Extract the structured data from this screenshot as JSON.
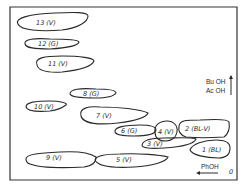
{
  "diagram": {
    "type": "two-dimensional paper chromatogram map",
    "solvents": {
      "vertical": "Bu OH / Ac OH",
      "vertical_top": "Bu OH",
      "vertical_bottom": "Ac OH",
      "horizontal": "PhOH"
    },
    "origin_label": "0",
    "spots": [
      {
        "id": "13",
        "label": "13 (V)"
      },
      {
        "id": "12",
        "label": "12 (G)"
      },
      {
        "id": "11",
        "label": "11 (V)"
      },
      {
        "id": "8",
        "label": "8 (G)"
      },
      {
        "id": "10",
        "label": "10 (V)"
      },
      {
        "id": "7",
        "label": "7 (V)"
      },
      {
        "id": "6",
        "label": "6 (G)"
      },
      {
        "id": "4",
        "label": "4 (V)"
      },
      {
        "id": "2",
        "label": "2 (BL-V)"
      },
      {
        "id": "3",
        "label": "3 (V)"
      },
      {
        "id": "1",
        "label": "1 (BL)"
      },
      {
        "id": "9",
        "label": "9 (V)"
      },
      {
        "id": "5",
        "label": "5 (V)"
      }
    ]
  }
}
